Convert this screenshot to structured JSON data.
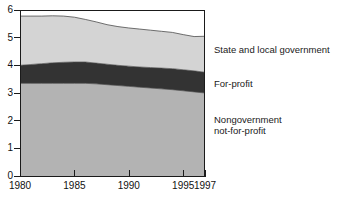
{
  "chart_data": {
    "type": "area",
    "stacked": true,
    "title": "",
    "subtitle": "",
    "xlabel": "",
    "ylabel": "",
    "xlim": [
      1980,
      1997
    ],
    "ylim": [
      0,
      6
    ],
    "grid": false,
    "legend_position": "right-inline-annotations",
    "x": [
      1980,
      1981,
      1982,
      1983,
      1984,
      1985,
      1986,
      1987,
      1988,
      1989,
      1990,
      1991,
      1992,
      1993,
      1994,
      1995,
      1996,
      1997
    ],
    "x_tick_labels": [
      "1980",
      "1985",
      "1990",
      "1995",
      "1997"
    ],
    "x_tick_values": [
      1980,
      1985,
      1990,
      1995,
      1997
    ],
    "y_tick_labels": [
      "0",
      "1",
      "2",
      "3",
      "4",
      "5",
      "6"
    ],
    "y_tick_values": [
      0,
      1,
      2,
      3,
      4,
      5,
      6
    ],
    "series": [
      {
        "name": "Nongovernment not-for-profit",
        "color": "#b3b3b3",
        "values": [
          3.35,
          3.35,
          3.35,
          3.35,
          3.35,
          3.35,
          3.35,
          3.33,
          3.3,
          3.27,
          3.24,
          3.21,
          3.18,
          3.15,
          3.12,
          3.08,
          3.04,
          3.0
        ]
      },
      {
        "name": "For-profit",
        "color": "#333333",
        "values": [
          0.65,
          0.68,
          0.71,
          0.74,
          0.76,
          0.77,
          0.77,
          0.75,
          0.74,
          0.73,
          0.73,
          0.73,
          0.74,
          0.75,
          0.76,
          0.76,
          0.76,
          0.75
        ]
      },
      {
        "name": "State and local government",
        "color": "#d4d4d4",
        "values": [
          1.78,
          1.75,
          1.72,
          1.7,
          1.67,
          1.62,
          1.54,
          1.49,
          1.43,
          1.4,
          1.38,
          1.37,
          1.35,
          1.33,
          1.31,
          1.27,
          1.24,
          1.3
        ]
      }
    ],
    "cumulative_tops": {
      "nongov_top": [
        3.35,
        3.35,
        3.35,
        3.35,
        3.35,
        3.35,
        3.35,
        3.33,
        3.3,
        3.27,
        3.24,
        3.21,
        3.18,
        3.15,
        3.12,
        3.08,
        3.04,
        3.0
      ],
      "forprofit_top": [
        4.0,
        4.03,
        4.06,
        4.09,
        4.11,
        4.12,
        4.12,
        4.08,
        4.04,
        4.0,
        3.97,
        3.94,
        3.92,
        3.9,
        3.88,
        3.84,
        3.8,
        3.75
      ],
      "total_top": [
        5.78,
        5.78,
        5.78,
        5.79,
        5.78,
        5.74,
        5.66,
        5.57,
        5.47,
        5.4,
        5.35,
        5.31,
        5.27,
        5.23,
        5.19,
        5.11,
        5.04,
        5.05
      ]
    },
    "annotations": [
      {
        "id": "state",
        "text": "State and local government"
      },
      {
        "id": "forprofit",
        "text": "For-profit"
      },
      {
        "id": "nongov",
        "text": "Nongovernment\nnot-for-profit"
      }
    ]
  },
  "axes": {
    "y_labels": [
      "6",
      "5",
      "4",
      "3",
      "2",
      "1",
      "0"
    ],
    "x_labels": [
      "1980",
      "1985",
      "1990",
      "1995",
      "1997"
    ]
  },
  "colors": {
    "state_local": "#d4d4d4",
    "for_profit": "#333333",
    "nongovernment": "#b3b3b3",
    "axis": "#1a1a1a",
    "background": "#ffffff"
  }
}
